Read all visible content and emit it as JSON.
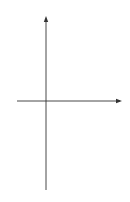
{
  "figure": {
    "equation_label": "y² = 4(1−x)",
    "equation_parts": {
      "lhs_var": "y",
      "lhs_exp": "2",
      "rhs": " = 4(1−x)"
    },
    "axes": {
      "x_label": "x",
      "y_label": "y",
      "origin_label": "O"
    },
    "ticks": {
      "x_one": "1",
      "y_two": "2",
      "y_neg_two": "−2"
    },
    "curve": {
      "equation": "y^2 = 4(1-x)",
      "vertex": [
        1,
        0
      ],
      "y_intercepts": [
        2,
        -2
      ]
    },
    "region": {
      "description": "shaded region between y-axis and parabola",
      "x_range": [
        0,
        1
      ],
      "y_range": [
        -2,
        2
      ],
      "hatch": "diagonal"
    },
    "colors": {
      "stroke": "#333333",
      "hatch": "#666666"
    }
  }
}
